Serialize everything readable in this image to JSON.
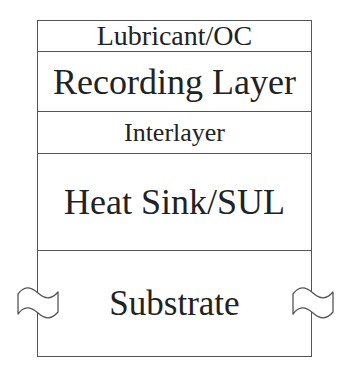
{
  "diagram": {
    "type": "layer-stack",
    "layers": [
      {
        "label": "Lubricant/OC"
      },
      {
        "label": "Recording Layer"
      },
      {
        "label": "Interlayer"
      },
      {
        "label": "Heat Sink/SUL"
      },
      {
        "label": "Substrate"
      }
    ],
    "break_symbols": [
      "left",
      "right"
    ],
    "colors": {
      "background": "#ffffff",
      "line": "#555555",
      "text": "#222222"
    }
  }
}
